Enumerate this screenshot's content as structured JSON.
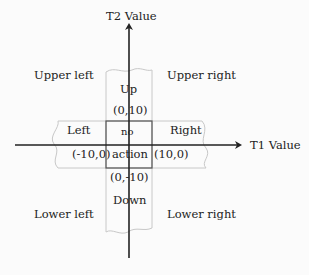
{
  "axes": {
    "x_label": "T1 Value",
    "y_label": "T2 Value"
  },
  "regions": {
    "upper_left": "Upper left",
    "upper_right": "Upper right",
    "lower_left": "Lower left",
    "lower_right": "Lower right",
    "up": "Up",
    "down": "Down",
    "left": "Left",
    "right": "Right",
    "center_line1": "no",
    "center_line2": "action"
  },
  "points": {
    "top": "(0,10)",
    "bottom": "(0,-10)",
    "left": "(-10,0)",
    "right": "(10,0)"
  },
  "colors": {
    "axis": "#222222",
    "box": "#555555",
    "band": "#c8c8c8"
  }
}
